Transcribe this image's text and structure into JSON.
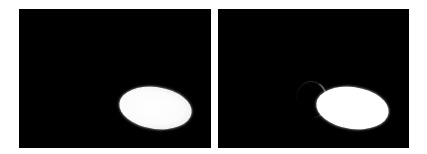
{
  "figure": {
    "panels": [
      {
        "id": "left",
        "background": "#000000",
        "object": "bright-ellipse",
        "object_color": "#ffffff"
      },
      {
        "id": "right",
        "background": "#000000",
        "object": "bright-ellipse-with-crescent-halo",
        "object_color": "#ffffff"
      }
    ],
    "page_background": "#ffffff"
  }
}
